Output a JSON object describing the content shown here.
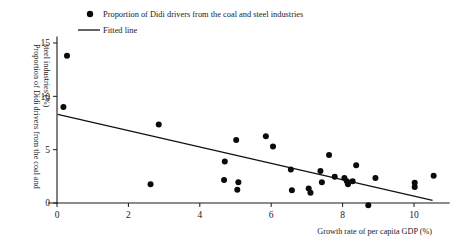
{
  "chart_data": {
    "type": "scatter",
    "title": "",
    "xlabel": "Growth rate of per capita GDP  (%)",
    "ylabel": "Proportion of Didi drivers from the coal and steel industries (%)",
    "ylabel_lines": [
      "Proportion of Didi drivers from the coal and",
      "steel industries (%)"
    ],
    "xlim": [
      -0.25,
      11.0
    ],
    "ylim": [
      -0.8,
      15.6
    ],
    "xticks": [
      0,
      2,
      4,
      6,
      8,
      10
    ],
    "xtick_labels": [
      "0",
      "2",
      "4",
      "6",
      "8",
      "10"
    ],
    "yticks": [
      0,
      5,
      10,
      15
    ],
    "ytick_labels": [
      "0",
      "5",
      "10",
      "15"
    ],
    "grid": false,
    "legend_position": "top-left",
    "legend": [
      {
        "label": "Proportion of Didi drivers from the coal and steel industries",
        "marker": "circle",
        "color": "#0b0b0b"
      },
      {
        "label": "Fitted line",
        "marker": "line",
        "color": "#111111"
      }
    ],
    "series": [
      {
        "name": "Proportion of Didi drivers from the coal and steel industries",
        "marker": "circle",
        "color": "#0b0b0b",
        "points": [
          [
            0.28,
            13.8
          ],
          [
            0.18,
            9.0
          ],
          [
            2.85,
            7.35
          ],
          [
            2.62,
            1.75
          ],
          [
            4.7,
            3.9
          ],
          [
            4.68,
            2.15
          ],
          [
            5.02,
            5.9
          ],
          [
            5.08,
            1.95
          ],
          [
            5.05,
            1.25
          ],
          [
            5.85,
            6.25
          ],
          [
            6.05,
            5.3
          ],
          [
            6.55,
            3.15
          ],
          [
            6.58,
            1.2
          ],
          [
            7.05,
            1.35
          ],
          [
            7.1,
            0.95
          ],
          [
            7.38,
            3.0
          ],
          [
            7.42,
            1.95
          ],
          [
            7.62,
            4.5
          ],
          [
            7.78,
            2.45
          ],
          [
            8.05,
            2.35
          ],
          [
            8.12,
            2.05
          ],
          [
            8.15,
            1.75
          ],
          [
            8.28,
            2.05
          ],
          [
            8.38,
            3.55
          ],
          [
            8.72,
            -0.2
          ],
          [
            8.92,
            2.35
          ],
          [
            10.02,
            1.9
          ],
          [
            10.02,
            1.5
          ],
          [
            10.55,
            2.55
          ]
        ]
      }
    ],
    "fit_line": {
      "name": "Fitted line",
      "color": "#111111",
      "x0": 0.02,
      "y0": 8.3,
      "x1": 10.52,
      "y1": 0.25,
      "slope": -0.767,
      "intercept": 8.32
    }
  }
}
